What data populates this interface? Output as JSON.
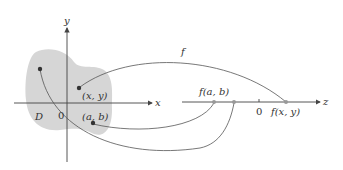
{
  "diagram": {
    "domain_label": "D",
    "origin_label": "0",
    "x_axis_label": "x",
    "y_axis_label": "y",
    "z_axis_label": "z",
    "z_origin_label": "0",
    "function_label": "f",
    "point_xy_label": "(x, y)",
    "point_ab_label": "(a, b)",
    "image_ab_label": "f(a, b)",
    "image_xy_label": "f(x, y)",
    "colors": {
      "region_fill": "#d6d6d6",
      "axis": "#444444",
      "curve": "#555555",
      "point": "#333333",
      "image_point": "#999999"
    }
  }
}
